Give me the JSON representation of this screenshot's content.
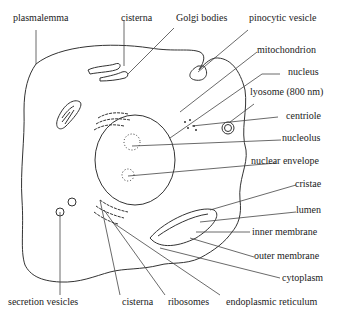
{
  "diagram": {
    "type": "cell-structure",
    "labels": {
      "plasmalemma": "plasmalemma",
      "cisterna_top": "cisterna",
      "golgi": "Golgi bodies",
      "pinocytic": "pinocytic vesicle",
      "mitochondrion": "mitochondrion",
      "nucleus": "nucleus",
      "lysosome": "lyosome (800 nm)",
      "centriole": "centriole",
      "nucleolus": "nucleolus",
      "nuclear_envelope": "nuclear envelope",
      "cristae": "cristae",
      "lumen": "lumen",
      "inner_membrane": "inner membrane",
      "outer_membrane": "outer membrane",
      "cytoplasm": "cytoplasm",
      "secretion": "secretion vesicles",
      "cisterna_bottom": "cisterna",
      "ribosomes": "ribosomes",
      "er": "endoplasmic reticulum"
    }
  }
}
